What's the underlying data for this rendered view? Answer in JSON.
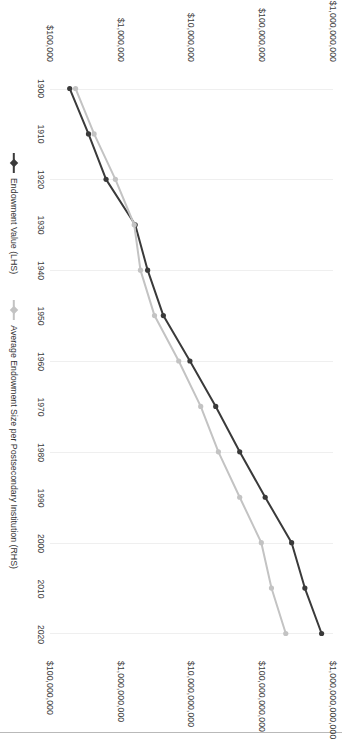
{
  "chart_data": {
    "type": "line",
    "title": "",
    "subtitle": "",
    "xlabel": "",
    "ylabel": "",
    "grid": true,
    "legend_position": "bottom",
    "x": [
      1900,
      1910,
      1920,
      1930,
      1940,
      1950,
      1960,
      1970,
      1980,
      1990,
      2000,
      2010,
      2020
    ],
    "xtick_labels": [
      "1900",
      "1910",
      "1920",
      "1930",
      "1940",
      "1950",
      "1960",
      "1970",
      "1980",
      "1990",
      "2000",
      "2010",
      "2020"
    ],
    "axes": {
      "left": {
        "name": "Endowment Value (LHS)",
        "scale": "log",
        "tick_labels": [
          "$100,000,000",
          "$1,000,000,000",
          "$10,000,000,000",
          "$100,000,000,000",
          "$1,000,000,000,000"
        ],
        "tick_values": [
          100000000,
          1000000000,
          10000000000,
          100000000000,
          1000000000000
        ],
        "ylim": [
          100000000,
          1000000000000
        ]
      },
      "right": {
        "name": "Average Endowment Size per Postsecondary Institution (RHS)",
        "scale": "log",
        "tick_labels": [
          "$100,000",
          "$1,000,000",
          "$10,000,000",
          "$100,000,000",
          "$1,000,000,000"
        ],
        "tick_values": [
          100000,
          1000000,
          10000000,
          100000000,
          1000000000
        ],
        "ylim": [
          100000,
          1000000000
        ]
      }
    },
    "series": [
      {
        "name": "Endowment Value (LHS)",
        "axis": "left",
        "color": "#3a3a3a",
        "marker": "diamond",
        "values": [
          190000000,
          350000000,
          620000000,
          1600000000,
          2400000000,
          4000000000,
          9500000000,
          22000000000,
          48000000000,
          110000000000,
          260000000000,
          400000000000,
          690000000000
        ]
      },
      {
        "name": "Average Endowment Size per Postsecondary Institution (RHS)",
        "axis": "right",
        "color": "#c3c3c3",
        "marker": "diamond",
        "values": [
          230000,
          420000,
          840000,
          1550000,
          1900000,
          3000000,
          6600000,
          13500000,
          24000000,
          48000000,
          97000000,
          135000000,
          215000000
        ]
      }
    ]
  },
  "legend": {
    "entries": [
      {
        "label": "Endowment Value (LHS)",
        "color": "#3a3a3a"
      },
      {
        "label": "Average Endowment Size per Postsecondary Institution (RHS)",
        "color": "#c3c3c3"
      }
    ]
  }
}
